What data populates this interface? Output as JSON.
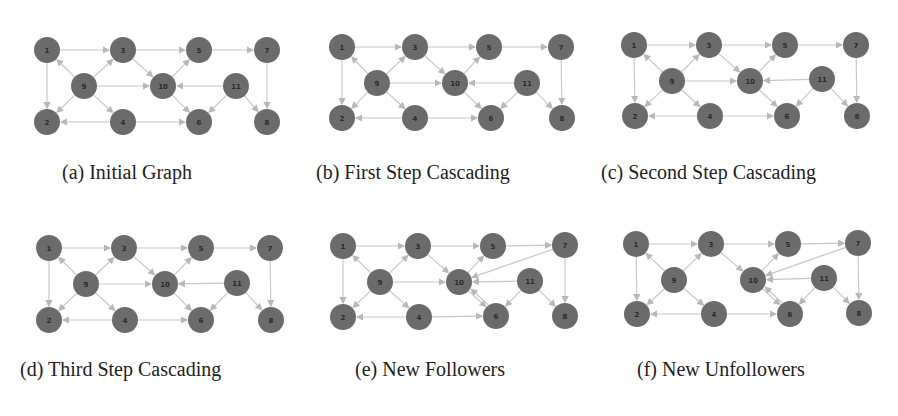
{
  "figure": {
    "node_color": "#6b6b6b",
    "edge_color": "#c8c8c8",
    "label_color": "#2a2a2a",
    "panels": [
      {
        "id": "a",
        "caption": "(a) Initial Graph",
        "origin": [
          0,
          0
        ],
        "caption_pos": [
          62,
          165
        ],
        "nodes": [
          {
            "id": "1",
            "x": 47,
            "y": 50
          },
          {
            "id": "3",
            "x": 123,
            "y": 50
          },
          {
            "id": "5",
            "x": 199,
            "y": 50
          },
          {
            "id": "7",
            "x": 267,
            "y": 50
          },
          {
            "id": "9",
            "x": 84,
            "y": 86
          },
          {
            "id": "10",
            "x": 163,
            "y": 86
          },
          {
            "id": "11",
            "x": 236,
            "y": 86
          },
          {
            "id": "2",
            "x": 47,
            "y": 122
          },
          {
            "id": "4",
            "x": 123,
            "y": 122
          },
          {
            "id": "6",
            "x": 199,
            "y": 122
          },
          {
            "id": "8",
            "x": 267,
            "y": 122
          }
        ],
        "edges": [
          [
            "1",
            "3"
          ],
          [
            "3",
            "5"
          ],
          [
            "5",
            "7"
          ],
          [
            "7",
            "8"
          ],
          [
            "1",
            "2"
          ],
          [
            "9",
            "1"
          ],
          [
            "9",
            "3"
          ],
          [
            "9",
            "2"
          ],
          [
            "9",
            "4"
          ],
          [
            "9",
            "10"
          ],
          [
            "3",
            "10"
          ],
          [
            "10",
            "5"
          ],
          [
            "10",
            "6"
          ],
          [
            "11",
            "10"
          ],
          [
            "11",
            "6"
          ],
          [
            "11",
            "8"
          ],
          [
            "4",
            "2"
          ],
          [
            "4",
            "6"
          ]
        ]
      },
      {
        "id": "b",
        "caption": "(b) First Step Cascading",
        "origin": [
          298,
          0
        ],
        "caption_pos": [
          316,
          165
        ],
        "nodes": [
          {
            "id": "1",
            "x": 342,
            "y": 47
          },
          {
            "id": "3",
            "x": 415,
            "y": 47
          },
          {
            "id": "5",
            "x": 489,
            "y": 47
          },
          {
            "id": "7",
            "x": 561,
            "y": 47
          },
          {
            "id": "9",
            "x": 377,
            "y": 83
          },
          {
            "id": "10",
            "x": 455,
            "y": 83
          },
          {
            "id": "11",
            "x": 527,
            "y": 83
          },
          {
            "id": "2",
            "x": 342,
            "y": 118
          },
          {
            "id": "4",
            "x": 415,
            "y": 118
          },
          {
            "id": "6",
            "x": 491,
            "y": 118
          },
          {
            "id": "8",
            "x": 562,
            "y": 118
          }
        ],
        "edges": [
          [
            "1",
            "3"
          ],
          [
            "3",
            "5"
          ],
          [
            "5",
            "7"
          ],
          [
            "7",
            "8"
          ],
          [
            "1",
            "2"
          ],
          [
            "9",
            "1"
          ],
          [
            "9",
            "3"
          ],
          [
            "9",
            "2"
          ],
          [
            "9",
            "4"
          ],
          [
            "9",
            "10"
          ],
          [
            "3",
            "10"
          ],
          [
            "10",
            "5"
          ],
          [
            "10",
            "6"
          ],
          [
            "11",
            "10"
          ],
          [
            "11",
            "6"
          ],
          [
            "11",
            "8"
          ],
          [
            "4",
            "2"
          ],
          [
            "4",
            "6"
          ]
        ]
      },
      {
        "id": "c",
        "caption": "(c) Second Step Cascading",
        "origin": [
          598,
          0
        ],
        "caption_pos": [
          601,
          165
        ],
        "nodes": [
          {
            "id": "1",
            "x": 634,
            "y": 45
          },
          {
            "id": "3",
            "x": 709,
            "y": 45
          },
          {
            "id": "5",
            "x": 785,
            "y": 45
          },
          {
            "id": "7",
            "x": 856,
            "y": 45
          },
          {
            "id": "9",
            "x": 672,
            "y": 81
          },
          {
            "id": "10",
            "x": 750,
            "y": 81
          },
          {
            "id": "11",
            "x": 822,
            "y": 79
          },
          {
            "id": "2",
            "x": 635,
            "y": 116
          },
          {
            "id": "4",
            "x": 710,
            "y": 116
          },
          {
            "id": "6",
            "x": 787,
            "y": 116
          },
          {
            "id": "8",
            "x": 857,
            "y": 116
          }
        ],
        "edges": [
          [
            "1",
            "3"
          ],
          [
            "3",
            "5"
          ],
          [
            "5",
            "7"
          ],
          [
            "7",
            "8"
          ],
          [
            "1",
            "2"
          ],
          [
            "9",
            "1"
          ],
          [
            "9",
            "3"
          ],
          [
            "9",
            "2"
          ],
          [
            "9",
            "4"
          ],
          [
            "9",
            "10"
          ],
          [
            "3",
            "10"
          ],
          [
            "10",
            "5"
          ],
          [
            "10",
            "6"
          ],
          [
            "11",
            "10"
          ],
          [
            "11",
            "6"
          ],
          [
            "11",
            "8"
          ],
          [
            "4",
            "2"
          ],
          [
            "4",
            "6"
          ]
        ]
      },
      {
        "id": "d",
        "caption": "(d) Third Step Cascading",
        "origin": [
          0,
          215
        ],
        "caption_pos": [
          20,
          362
        ],
        "nodes": [
          {
            "id": "1",
            "x": 49,
            "y": 248
          },
          {
            "id": "3",
            "x": 124,
            "y": 248
          },
          {
            "id": "5",
            "x": 201,
            "y": 248
          },
          {
            "id": "7",
            "x": 270,
            "y": 248
          },
          {
            "id": "9",
            "x": 86,
            "y": 284
          },
          {
            "id": "10",
            "x": 165,
            "y": 284
          },
          {
            "id": "11",
            "x": 237,
            "y": 283
          },
          {
            "id": "2",
            "x": 49,
            "y": 320
          },
          {
            "id": "4",
            "x": 125,
            "y": 320
          },
          {
            "id": "6",
            "x": 201,
            "y": 320
          },
          {
            "id": "8",
            "x": 271,
            "y": 320
          }
        ],
        "edges": [
          [
            "1",
            "3"
          ],
          [
            "3",
            "5"
          ],
          [
            "5",
            "7"
          ],
          [
            "7",
            "8"
          ],
          [
            "1",
            "2"
          ],
          [
            "9",
            "1"
          ],
          [
            "9",
            "3"
          ],
          [
            "9",
            "2"
          ],
          [
            "9",
            "4"
          ],
          [
            "9",
            "10"
          ],
          [
            "3",
            "10"
          ],
          [
            "10",
            "5"
          ],
          [
            "10",
            "6"
          ],
          [
            "11",
            "10"
          ],
          [
            "11",
            "6"
          ],
          [
            "11",
            "8"
          ],
          [
            "4",
            "2"
          ],
          [
            "4",
            "6"
          ]
        ]
      },
      {
        "id": "e",
        "caption": "(e) New Followers",
        "origin": [
          298,
          215
        ],
        "caption_pos": [
          355,
          362
        ],
        "nodes": [
          {
            "id": "1",
            "x": 343,
            "y": 246
          },
          {
            "id": "3",
            "x": 418,
            "y": 246
          },
          {
            "id": "5",
            "x": 493,
            "y": 246
          },
          {
            "id": "7",
            "x": 565,
            "y": 245
          },
          {
            "id": "9",
            "x": 380,
            "y": 282
          },
          {
            "id": "10",
            "x": 459,
            "y": 282
          },
          {
            "id": "11",
            "x": 530,
            "y": 281
          },
          {
            "id": "2",
            "x": 343,
            "y": 317
          },
          {
            "id": "4",
            "x": 419,
            "y": 317
          },
          {
            "id": "6",
            "x": 496,
            "y": 316
          },
          {
            "id": "8",
            "x": 565,
            "y": 316
          }
        ],
        "edges": [
          [
            "1",
            "3"
          ],
          [
            "3",
            "5"
          ],
          [
            "5",
            "7"
          ],
          [
            "7",
            "8"
          ],
          [
            "1",
            "2"
          ],
          [
            "9",
            "1"
          ],
          [
            "9",
            "3"
          ],
          [
            "9",
            "2"
          ],
          [
            "9",
            "4"
          ],
          [
            "9",
            "10"
          ],
          [
            "3",
            "10"
          ],
          [
            "10",
            "5"
          ],
          [
            "10",
            "6"
          ],
          [
            "6",
            "10"
          ],
          [
            "7",
            "10"
          ],
          [
            "11",
            "10"
          ],
          [
            "11",
            "6"
          ],
          [
            "11",
            "8"
          ],
          [
            "4",
            "2"
          ],
          [
            "4",
            "6"
          ]
        ]
      },
      {
        "id": "f",
        "caption": "(f) New Unfollowers",
        "origin": [
          598,
          215
        ],
        "caption_pos": [
          637,
          362
        ],
        "nodes": [
          {
            "id": "1",
            "x": 636,
            "y": 244
          },
          {
            "id": "3",
            "x": 711,
            "y": 244
          },
          {
            "id": "5",
            "x": 788,
            "y": 244
          },
          {
            "id": "7",
            "x": 858,
            "y": 243
          },
          {
            "id": "9",
            "x": 674,
            "y": 280
          },
          {
            "id": "10",
            "x": 753,
            "y": 280
          },
          {
            "id": "11",
            "x": 824,
            "y": 278
          },
          {
            "id": "2",
            "x": 637,
            "y": 314
          },
          {
            "id": "4",
            "x": 714,
            "y": 314
          },
          {
            "id": "6",
            "x": 790,
            "y": 314
          },
          {
            "id": "8",
            "x": 859,
            "y": 313
          }
        ],
        "edges": [
          [
            "1",
            "3"
          ],
          [
            "3",
            "5"
          ],
          [
            "5",
            "7"
          ],
          [
            "7",
            "8"
          ],
          [
            "1",
            "2"
          ],
          [
            "9",
            "1"
          ],
          [
            "9",
            "3"
          ],
          [
            "9",
            "2"
          ],
          [
            "9",
            "4"
          ],
          [
            "3",
            "10"
          ],
          [
            "10",
            "5"
          ],
          [
            "10",
            "6"
          ],
          [
            "6",
            "10"
          ],
          [
            "7",
            "10"
          ],
          [
            "11",
            "10"
          ],
          [
            "11",
            "6"
          ],
          [
            "11",
            "8"
          ],
          [
            "4",
            "2"
          ],
          [
            "4",
            "6"
          ]
        ]
      }
    ]
  }
}
